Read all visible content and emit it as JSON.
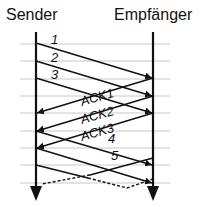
{
  "diagram": {
    "title_left": "Sender",
    "title_right": "Empfänger",
    "colors": {
      "line": "#111111",
      "grid": "#c8c8c8",
      "background": "#ffffff"
    },
    "timeline_x": {
      "sender": 36,
      "receiver": 153
    },
    "grid_y": [
      44,
      61,
      79,
      96,
      113,
      131,
      148,
      165,
      183
    ],
    "messages": [
      {
        "label": "1",
        "direction": "sender-to-receiver",
        "from_y": 43,
        "to_y": 78,
        "style": "solid"
      },
      {
        "label": "2",
        "direction": "sender-to-receiver",
        "from_y": 61,
        "to_y": 96,
        "style": "solid"
      },
      {
        "label": "3",
        "direction": "sender-to-receiver",
        "from_y": 78,
        "to_y": 113,
        "style": "solid"
      },
      {
        "label": "ACK1",
        "direction": "receiver-to-sender",
        "from_y": 78,
        "to_y": 113,
        "style": "solid"
      },
      {
        "label": "ACK2",
        "direction": "receiver-to-sender",
        "from_y": 96,
        "to_y": 131,
        "style": "solid"
      },
      {
        "label": "ACK3",
        "direction": "receiver-to-sender",
        "from_y": 113,
        "to_y": 148,
        "style": "solid"
      },
      {
        "label": "4",
        "direction": "sender-to-receiver",
        "from_y": 131,
        "to_y": 165,
        "style": "solid"
      },
      {
        "label": "5",
        "direction": "sender-to-receiver",
        "from_y": 148,
        "to_y": 183,
        "style": "solid"
      },
      {
        "label": "",
        "direction": "receiver-to-sender",
        "from_y": 165,
        "to_y": 183,
        "style": "solid-then-dashed"
      },
      {
        "label": "",
        "direction": "sender-to-receiver",
        "from_y": 165,
        "to_y": 188,
        "style": "solid-then-dashed"
      }
    ]
  }
}
